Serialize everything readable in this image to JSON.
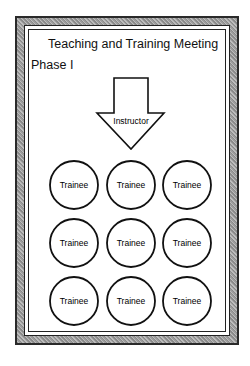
{
  "title": "Teaching and Training Meeting",
  "phase": "Phase I",
  "arrow": {
    "label": "Instructor",
    "direction": "down"
  },
  "trainees": [
    {
      "label": "Trainee",
      "cx": 74,
      "cy": 185
    },
    {
      "label": "Trainee",
      "cx": 131,
      "cy": 185
    },
    {
      "label": "Trainee",
      "cx": 187,
      "cy": 185
    },
    {
      "label": "Trainee",
      "cx": 74,
      "cy": 243
    },
    {
      "label": "Trainee",
      "cx": 131,
      "cy": 243
    },
    {
      "label": "Trainee",
      "cx": 187,
      "cy": 243
    },
    {
      "label": "Trainee",
      "cx": 74,
      "cy": 301
    },
    {
      "label": "Trainee",
      "cx": 131,
      "cy": 301
    },
    {
      "label": "Trainee",
      "cx": 187,
      "cy": 301
    }
  ],
  "colors": {
    "stroke": "#111111",
    "frame": "#9d9d9d",
    "background": "#ffffff"
  }
}
